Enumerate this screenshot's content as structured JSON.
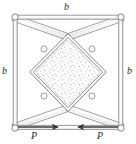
{
  "figure": {
    "type": "engineering-schematic",
    "colors": {
      "outline": "#6e6e6e",
      "member_fill": "#fbfbfb",
      "core_fill": "#fdfdfd",
      "stipple": "#8a8a8a",
      "arrow": "#3a3a3a",
      "label_text": "#2a2a2a",
      "background": "#ffffff"
    },
    "labels": {
      "dimension_top": "b",
      "dimension_left": "b",
      "dimension_right": "b",
      "force_left": "P",
      "force_right": "P"
    },
    "geometry": {
      "frame": {
        "shape": "square",
        "corners": [
          [
            15,
            17
          ],
          [
            121,
            17
          ],
          [
            121,
            128
          ],
          [
            15,
            128
          ]
        ],
        "member_width_px": 4,
        "pin_radius_px": 3
      },
      "core": {
        "shape": "rhombus",
        "vertices_top": [
          68,
          37
        ],
        "vertices_right": [
          103,
          72
        ],
        "vertices_bottom": [
          68,
          108
        ],
        "vertices_left": [
          33,
          72
        ],
        "hatch": "stipple",
        "border": "double-line"
      },
      "braces": [
        {
          "name": "brace-top-left",
          "from": [
            15,
            17
          ],
          "to": [
            68,
            37
          ]
        },
        {
          "name": "brace-top-right",
          "from": [
            121,
            17
          ],
          "to": [
            68,
            37
          ]
        },
        {
          "name": "brace-bottom-left",
          "from": [
            15,
            128
          ],
          "to": [
            68,
            108
          ]
        },
        {
          "name": "brace-bottom-right",
          "from": [
            121,
            128
          ],
          "to": [
            68,
            108
          ]
        }
      ],
      "forces": [
        {
          "name": "force-left",
          "label": "P",
          "direction": "right",
          "tail": [
            18,
            127
          ],
          "head": [
            60,
            127
          ]
        },
        {
          "name": "force-right",
          "label": "P",
          "direction": "left",
          "tail": [
            118,
            127
          ],
          "head": [
            76,
            127
          ]
        }
      ]
    }
  }
}
